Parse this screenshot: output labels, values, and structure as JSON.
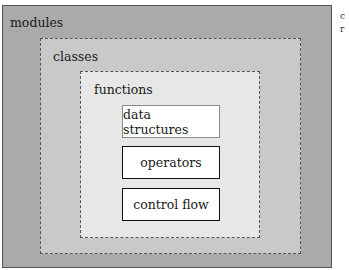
{
  "diagram": {
    "type": "nested-scopes",
    "levels": [
      {
        "label": "modules",
        "style": "solid",
        "fill": "#aaaaaa"
      },
      {
        "label": "classes",
        "style": "dashed",
        "fill": "#c9c9c9"
      },
      {
        "label": "functions",
        "style": "dashed",
        "fill": "#e7e7e7"
      }
    ],
    "items": [
      {
        "label": "data structures",
        "border": "light"
      },
      {
        "label": "operators",
        "border": "dark"
      },
      {
        "label": "control flow",
        "border": "dark"
      }
    ],
    "edge_text": [
      "c",
      "r"
    ]
  }
}
